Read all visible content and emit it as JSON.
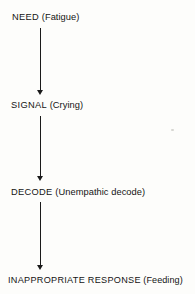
{
  "figure": {
    "type": "flowchart",
    "orientation": "vertical",
    "background_color": "#fdfdfb",
    "text_color": "#141414",
    "arrow_color": "#1a1a1a",
    "nodes": [
      {
        "id": "need",
        "term": "NEED",
        "detail": "(Fatigue)"
      },
      {
        "id": "signal",
        "term": "SIGNAL",
        "detail": "(Crying)"
      },
      {
        "id": "decode",
        "term": "DECODE",
        "detail": "(Unempathic decode)"
      },
      {
        "id": "response",
        "term": "INAPPROPRIATE RESPONSE",
        "detail": "(Feeding)"
      }
    ],
    "connectors": [
      {
        "id": "arrow-1",
        "from": "need",
        "to": "signal",
        "glyph": "down-arrow"
      },
      {
        "id": "arrow-2",
        "from": "signal",
        "to": "decode",
        "glyph": "down-arrow"
      },
      {
        "id": "arrow-3",
        "from": "decode",
        "to": "response",
        "glyph": "down-arrow"
      }
    ]
  }
}
